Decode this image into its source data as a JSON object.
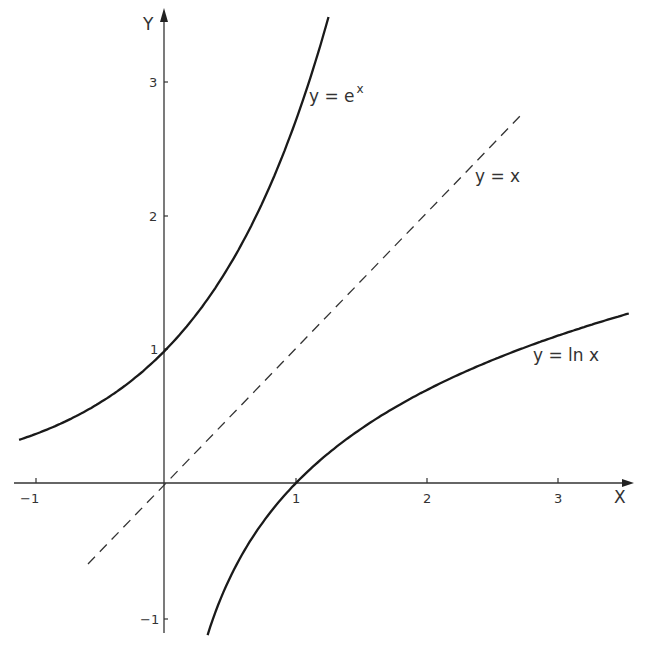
{
  "chart_data": {
    "type": "line",
    "title": "",
    "xlabel": "X",
    "ylabel": "Y",
    "xlim": [
      -1.15,
      3.6
    ],
    "ylim": [
      -1.13,
      3.6
    ],
    "grid": false,
    "legend": "none (inline curve labels)",
    "x_ticks": [
      "-1",
      "1",
      "2",
      "3"
    ],
    "y_ticks": [
      "-1",
      "1",
      "2",
      "3"
    ],
    "series": [
      {
        "name": "y = e^x",
        "style": "solid",
        "function": "exp(x)",
        "x_range": [
          -1.13,
          1.25
        ],
        "x": [
          -1.13,
          -1,
          -0.5,
          0,
          0.5,
          1,
          1.25
        ],
        "values": [
          0.32,
          0.37,
          0.61,
          1.0,
          1.65,
          2.72,
          3.49
        ]
      },
      {
        "name": "y = x",
        "style": "dashed",
        "function": "x",
        "x_range": [
          -0.6,
          2.74
        ],
        "x": [
          -0.6,
          0,
          1,
          2,
          2.74
        ],
        "values": [
          -0.6,
          0,
          1,
          2,
          2.74
        ]
      },
      {
        "name": "y = ln x",
        "style": "solid",
        "function": "ln(x)",
        "x_range": [
          0.32,
          3.56
        ],
        "x": [
          0.32,
          0.5,
          1,
          2,
          3,
          3.56
        ],
        "values": [
          -1.14,
          -0.69,
          0,
          0.69,
          1.1,
          1.27
        ]
      }
    ],
    "annotations": [
      {
        "text": "y = e",
        "superscript": "x",
        "near": "exp curve"
      },
      {
        "text": "y = x",
        "near": "dashed line"
      },
      {
        "text": "y = ln x",
        "near": "log curve"
      }
    ]
  },
  "labels": {
    "x_axis": "X",
    "y_axis": "Y",
    "exp_main": "y = e",
    "exp_sup": "x",
    "identity": "y = x",
    "log": "y = ln x",
    "tick_x_m1": "−1",
    "tick_x_1": "1",
    "tick_x_2": "2",
    "tick_x_3": "3",
    "tick_y_m1": "−1",
    "tick_y_1": "1",
    "tick_y_2": "2",
    "tick_y_3": "3"
  },
  "colors": {
    "ink": "#1a1a1a",
    "background": "#ffffff"
  }
}
